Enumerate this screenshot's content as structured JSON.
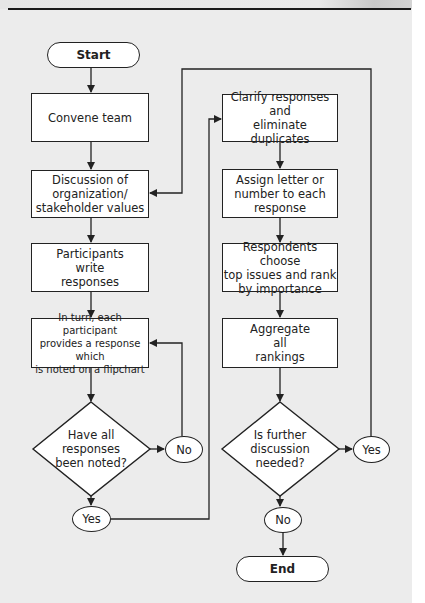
{
  "diagram": {
    "type": "flowchart",
    "colors": {
      "background": "#ececec",
      "box_fill": "#ffffff",
      "stroke": "#222222"
    },
    "left_column": {
      "start": "Start",
      "convene": "Convene team",
      "discussion": "Discussion of\norganization/\nstakeholder values",
      "participants": "Participants\nwrite\nresponses",
      "in_turn": "In turn, each participant\nprovides a response which\nis noted on a flipchart",
      "decision": "Have all\nresponses\nbeen noted?",
      "decision_no": "No",
      "decision_yes": "Yes"
    },
    "right_column": {
      "clarify": "Clarify responses and\neliminate duplicates",
      "assign": "Assign letter or\nnumber to each\nresponse",
      "respondents": "Respondents choose\ntop issues and rank\nby importance",
      "aggregate": "Aggregate\nall\nrankings",
      "decision": "Is further\ndiscussion\nneeded?",
      "decision_yes": "Yes",
      "decision_no": "No",
      "end": "End"
    }
  }
}
